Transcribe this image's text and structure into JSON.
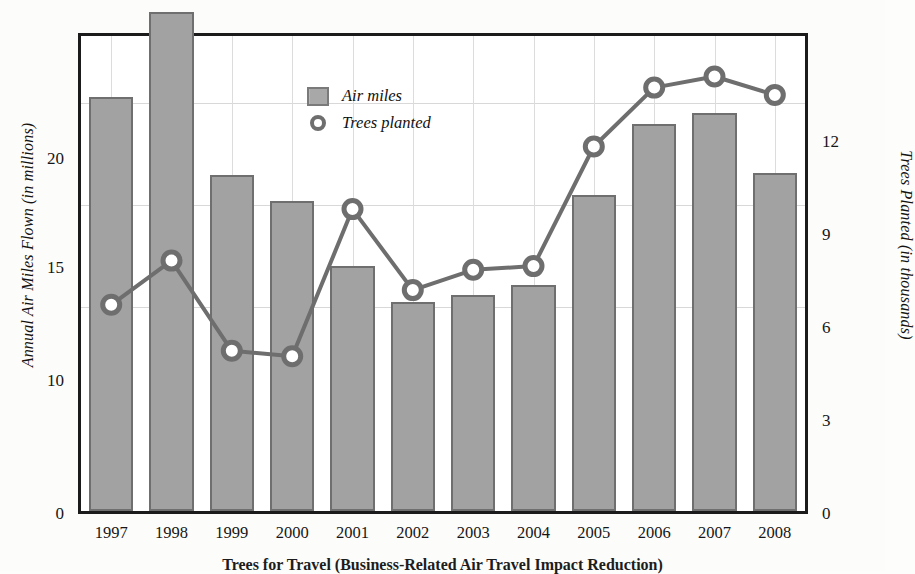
{
  "chart_data": {
    "type": "bar",
    "title": "Trees for Travel (Business-Related Air Travel Impact Reduction)",
    "xlabel": "",
    "ylabel": "Annual Air Miles Flown (in millions)",
    "ylabel_right": "Trees Planted (in thousands)",
    "categories": [
      "1997",
      "1998",
      "1999",
      "2000",
      "2001",
      "2002",
      "2003",
      "2004",
      "2005",
      "2006",
      "2007",
      "2008"
    ],
    "grid": true,
    "legend_position": "top-center-left",
    "series": [
      {
        "name": "Air miles",
        "type": "bar",
        "axis": "left",
        "unit": "millions",
        "color": "#a2a2a2",
        "edge_color": "#6f6f6f",
        "values": [
          20.3,
          24.5,
          16.5,
          15.2,
          12.0,
          10.25,
          10.6,
          11.1,
          15.5,
          19.0,
          19.5,
          16.6
        ]
      },
      {
        "name": "Trees planted",
        "type": "line",
        "axis": "right",
        "unit": "thousands",
        "color": "#6e6e6e",
        "marker": "circle-open",
        "values": [
          5.6,
          6.8,
          4.35,
          4.2,
          8.2,
          6.0,
          6.55,
          6.65,
          9.9,
          11.5,
          11.8,
          11.3
        ]
      }
    ],
    "yaxis_left": {
      "ticks": [
        0,
        10,
        15,
        20
      ],
      "labels": [
        "0",
        "10",
        "15",
        "20"
      ],
      "min": 0,
      "max": 23.3
    },
    "yaxis_right": {
      "ticks": [
        0,
        3,
        6,
        9,
        12
      ],
      "labels": [
        "0",
        "3",
        "6",
        "9",
        "12"
      ],
      "min": 0,
      "max": 12.9
    }
  },
  "legend": {
    "items": [
      {
        "label": "Air miles",
        "icon": "bar-swatch"
      },
      {
        "label": "Trees planted",
        "icon": "circle-marker"
      }
    ]
  },
  "axes": {
    "left_title": "Annual Air Miles Flown (in millions)",
    "right_title": "Trees Planted (in thousands)"
  },
  "caption": "Trees for Travel (Business-Related Air Travel Impact Reduction)"
}
